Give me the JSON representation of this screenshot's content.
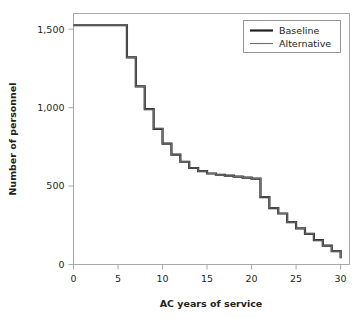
{
  "chart_data": {
    "type": "line",
    "title": "",
    "subtitle": "",
    "xlabel": "AC years of service",
    "ylabel": "Number of personnel",
    "xlim": [
      0,
      31
    ],
    "ylim": [
      0,
      1600
    ],
    "xticks": [
      0,
      5,
      10,
      15,
      20,
      25,
      30
    ],
    "xticklabels": [
      "0",
      "5",
      "10",
      "15",
      "20",
      "25",
      "30"
    ],
    "yticks": [
      0,
      500,
      1000,
      1500
    ],
    "yticklabels": [
      "0",
      "500",
      "1,000",
      "1,500"
    ],
    "grid": false,
    "legend_position": "top-right",
    "step_style": "post",
    "series": [
      {
        "name": "Baseline",
        "color": "#231f20",
        "line_width": 2.2,
        "x": [
          0,
          1,
          2,
          3,
          4,
          5,
          6,
          7,
          8,
          9,
          10,
          11,
          12,
          13,
          14,
          15,
          16,
          17,
          18,
          19,
          20,
          21,
          22,
          23,
          24,
          25,
          26,
          27,
          28,
          29,
          30
        ],
        "values": [
          1525,
          1525,
          1525,
          1525,
          1525,
          1525,
          1320,
          1135,
          990,
          865,
          770,
          700,
          655,
          615,
          595,
          580,
          572,
          566,
          560,
          554,
          548,
          430,
          360,
          325,
          270,
          230,
          195,
          155,
          120,
          85,
          40
        ]
      },
      {
        "name": "Alternative",
        "color": "#6d6e71",
        "line_width": 1.1,
        "x": [
          0,
          1,
          2,
          3,
          4,
          5,
          6,
          7,
          8,
          9,
          10,
          11,
          12,
          13,
          14,
          15,
          16,
          17,
          18,
          19,
          20,
          21,
          22,
          23,
          24,
          25,
          26,
          27,
          28,
          29,
          30
        ],
        "values": [
          1525,
          1525,
          1525,
          1525,
          1525,
          1525,
          1320,
          1135,
          990,
          865,
          770,
          700,
          655,
          615,
          595,
          580,
          572,
          566,
          560,
          554,
          548,
          430,
          360,
          325,
          270,
          230,
          195,
          155,
          120,
          85,
          40
        ]
      }
    ]
  },
  "legend": {
    "entries": [
      {
        "label": "Baseline",
        "color": "#231f20",
        "width": 2.2
      },
      {
        "label": "Alternative",
        "color": "#6d6e71",
        "width": 1.1
      }
    ]
  },
  "axes": {
    "x_title": "AC years of service",
    "y_title": "Number of personnel",
    "x_tick_labels": [
      "0",
      "5",
      "10",
      "15",
      "20",
      "25",
      "30"
    ],
    "y_tick_labels": [
      "0",
      "500",
      "1,000",
      "1,500"
    ]
  },
  "colors": {
    "background": "#ffffff",
    "frame": "#a7a9ac",
    "axis_line": "#a7a9ac",
    "text": "#231f20",
    "baseline": "#231f20",
    "alternative": "#6d6e71"
  }
}
